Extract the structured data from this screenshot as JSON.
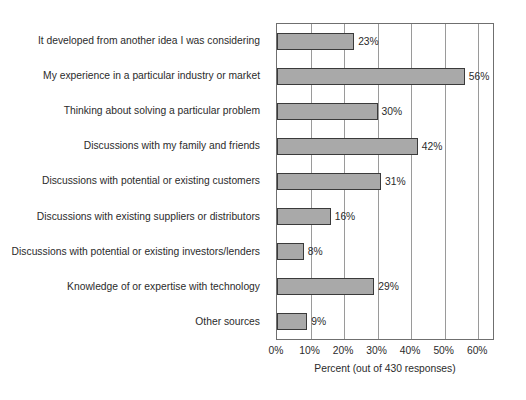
{
  "chart_data": {
    "type": "bar",
    "orientation": "horizontal",
    "title": "",
    "xlabel": "Percent (out of 430 responses)",
    "ylabel": "",
    "xlim": [
      0,
      65
    ],
    "xticks": [
      "0%",
      "10%",
      "20%",
      "30%",
      "40%",
      "50%",
      "60%"
    ],
    "xtick_values": [
      0,
      10,
      20,
      30,
      40,
      50,
      60
    ],
    "grid": true,
    "legend": null,
    "bar_color": "#a9a9a9",
    "bar_border_color": "#3a3a3a",
    "categories": [
      "It developed from another idea I was considering",
      "My experience in a particular industry or market",
      "Thinking about solving a particular problem",
      "Discussions with my family and friends",
      "Discussions with potential or existing customers",
      "Discussions with existing suppliers or distributors",
      "Discussions with potential or existing investors/lenders",
      "Knowledge of or expertise with technology",
      "Other sources"
    ],
    "values": [
      23,
      56,
      30,
      42,
      31,
      16,
      8,
      29,
      9
    ],
    "value_labels": [
      "23%",
      "56%",
      "30%",
      "42%",
      "31%",
      "16%",
      "8%",
      "29%",
      "9%"
    ]
  }
}
